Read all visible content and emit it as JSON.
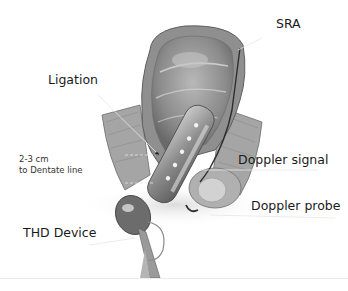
{
  "figure": {
    "labels": {
      "sra": "SRA",
      "ligation": "Ligation",
      "distance_line1": "2-3 cm",
      "distance_line2": "to Dentate line",
      "doppler_signal": "Doppler signal",
      "doppler_probe": "Doppler probe",
      "thd_device": "THD Device"
    },
    "colors": {
      "background": "#ffffff",
      "text": "#1a1a1a",
      "tissue_dark": "#6e6e6e",
      "tissue_mid": "#9a9a9a",
      "tissue_light": "#c8c8c8",
      "leader_line": "#e8e8e8"
    }
  }
}
